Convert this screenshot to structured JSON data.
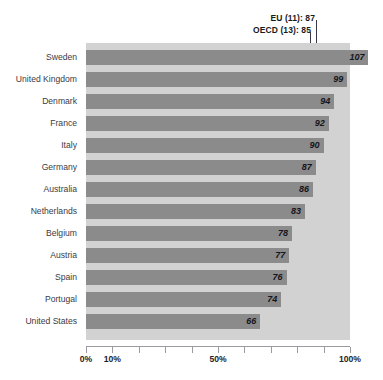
{
  "chart_data": {
    "type": "bar",
    "orientation": "horizontal",
    "title": "",
    "subtitle": "",
    "xlabel": "",
    "ylabel": "",
    "xlim": [
      0,
      100
    ],
    "x_unit": "%",
    "grid": false,
    "legend": "none",
    "categories": [
      "Sweden",
      "United Kingdom",
      "Denmark",
      "France",
      "Italy",
      "Germany",
      "Australia",
      "Netherlands",
      "Belgium",
      "Austria",
      "Spain",
      "Portugal",
      "United States"
    ],
    "values": [
      107,
      99,
      94,
      92,
      90,
      87,
      86,
      83,
      78,
      77,
      76,
      74,
      66
    ],
    "tick_values": [
      0,
      10,
      20,
      30,
      40,
      50,
      60,
      70,
      80,
      90,
      100
    ],
    "tick_labels_shown": [
      {
        "value": 0,
        "label": "0%"
      },
      {
        "value": 10,
        "label": "10%"
      },
      {
        "value": 50,
        "label": "50%"
      },
      {
        "value": 100,
        "label": "100%"
      }
    ],
    "annotations": [
      {
        "name": "eu-reference-line",
        "label": "EU (11): 87",
        "value": 87
      },
      {
        "name": "oecd-reference-line",
        "label": "OECD (13): 85",
        "value": 85
      }
    ],
    "colors": {
      "bar": "#8b8b8b",
      "plot_background": "#d2d2d2",
      "reference_line": "#3a3a46",
      "axis": "#9a9aa2",
      "value_text": "#15151b",
      "category_text": "#3b3b44"
    }
  }
}
